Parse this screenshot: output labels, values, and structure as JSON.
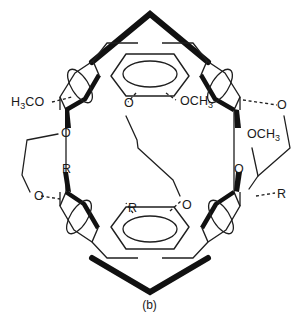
{
  "figure": {
    "caption": "(b)",
    "type": "chemical-structure-diagram"
  },
  "colors": {
    "ink": "#1a1a1a",
    "bold_bond": "#111111",
    "thin_bond": "#1f1f1f",
    "background": "#ffffff"
  },
  "labels": {
    "methoxy_left": "H3CO",
    "oxygen_top_center": "O",
    "methoxy_top_center": "OCH3",
    "oxygen_right_upper": "O",
    "methoxy_right": "OCH3",
    "oxygen_left_upper": "O",
    "oxygen_left_lower": "O",
    "substituent_left": "R",
    "substituent_bottom_center": "R",
    "oxygen_bottom_center": "O",
    "oxygen_right_lower": "O",
    "substituent_right": "R"
  },
  "label_parts": {
    "methoxy_left": {
      "pre": "H",
      "sub1": "3",
      "post": "CO"
    },
    "methoxy_top_center": {
      "pre": "OCH",
      "sub1": "3",
      "post": ""
    },
    "methoxy_right": {
      "pre": "OCH",
      "sub1": "3",
      "post": ""
    }
  }
}
